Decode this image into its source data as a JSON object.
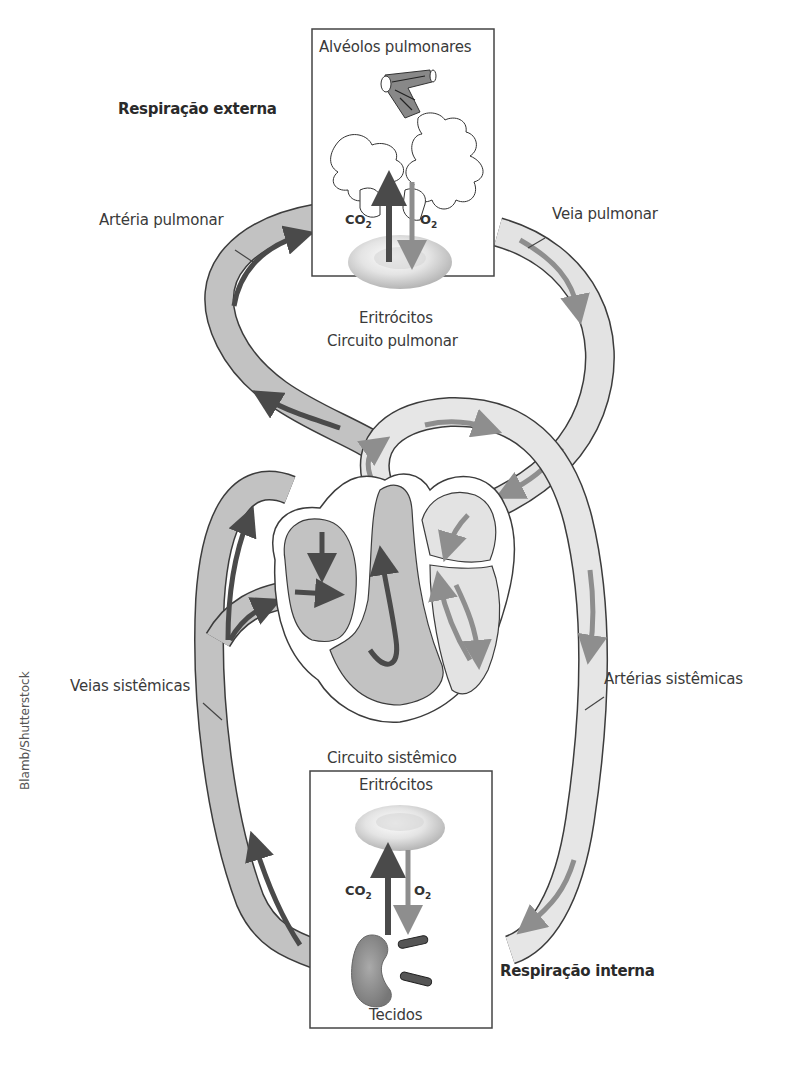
{
  "labels": {
    "external_respiration": "Respiração externa",
    "internal_respiration": "Respiração interna",
    "pulmonary_alveoli": "Alvéolos pulmonares",
    "erythrocytes_top": "Eritrócitos",
    "pulmonary_circuit": "Circuito pulmonar",
    "pulmonary_artery": "Artéria pulmonar",
    "pulmonary_vein": "Veia pulmonar",
    "systemic_veins": "Veias sistêmicas",
    "systemic_arteries": "Artérias sistêmicas",
    "systemic_circuit": "Circuito sistêmico",
    "erythrocytes_bottom": "Eritrócitos",
    "tissues": "Tecidos",
    "credit": "Blamb/Shutterstock"
  },
  "gases": {
    "top_co2": "CO",
    "top_co2_sub": "2",
    "top_o2": "O",
    "top_o2_sub": "2",
    "bottom_co2": "CO",
    "bottom_co2_sub": "2",
    "bottom_o2": "O",
    "bottom_o2_sub": "2"
  },
  "colors": {
    "deoxygenated_vessel": "#bdbdbd",
    "oxygenated_vessel": "#e3e3e3",
    "dark_arrow": "#4a4a4a",
    "light_arrow": "#8e8e8e",
    "outline": "#3c3c3c"
  }
}
